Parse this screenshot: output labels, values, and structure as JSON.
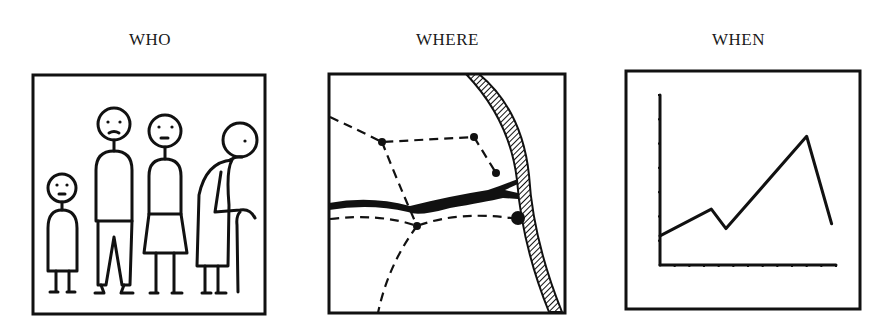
{
  "panels": [
    {
      "id": "who",
      "title": "WHO",
      "description": "Four stick figures: child, man, woman, elderly person with cane"
    },
    {
      "id": "where",
      "title": "WHERE",
      "description": "Map sketch with dashed routes, nodes, a thick river and hatched coastline"
    },
    {
      "id": "when",
      "title": "WHEN",
      "description": "Line chart over time"
    }
  ],
  "colors": {
    "ink": "#111111",
    "background": "#ffffff"
  },
  "chart_data": {
    "type": "line",
    "title": "WHEN",
    "xlabel": "",
    "ylabel": "",
    "x": [
      0,
      3.5,
      4.5,
      10,
      11.7
    ],
    "values": [
      1.2,
      2.3,
      1.5,
      5.3,
      1.7
    ],
    "x_ticks": 12,
    "y_ticks": 7,
    "ylim": [
      0,
      7
    ],
    "grid": false,
    "legend": null
  }
}
